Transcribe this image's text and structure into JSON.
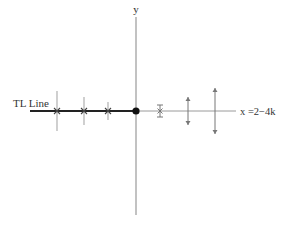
{
  "diagram": {
    "type": "number-line-with-markers",
    "axes": {
      "y_label": "y",
      "x_label": "x =2−4k"
    },
    "tl_line": {
      "label": "TL Line"
    },
    "origin": {
      "marker": "filled-dot"
    },
    "left_markers": [
      {
        "kind": "tick-with-cross",
        "extent": "long"
      },
      {
        "kind": "tick-with-cross",
        "extent": "medium"
      },
      {
        "kind": "tick-with-cross",
        "extent": "short"
      }
    ],
    "right_markers": [
      {
        "kind": "bowtie",
        "extent": "short"
      },
      {
        "kind": "double-arrow",
        "extent": "medium"
      },
      {
        "kind": "double-arrow",
        "extent": "long"
      }
    ],
    "colors": {
      "tl_line": "#222222",
      "axis": "#9a9a9a",
      "marker": "#777777",
      "origin_dot": "#111111",
      "text": "#333333"
    }
  }
}
